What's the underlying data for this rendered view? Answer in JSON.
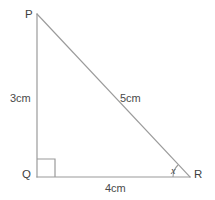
{
  "figure": {
    "kind": "geometry-diagram",
    "shape": "right-triangle",
    "background_color": "#ffffff",
    "stroke_color": "#9a9a9a",
    "text_color": "#4a4a4a",
    "vertices": [
      {
        "name": "P",
        "label": "P",
        "x": 37,
        "y": 14
      },
      {
        "name": "Q",
        "label": "Q",
        "x": 37,
        "y": 177
      },
      {
        "name": "R",
        "label": "R",
        "x": 190,
        "y": 177
      }
    ],
    "sides": [
      {
        "name": "PQ",
        "label": "3cm",
        "value": 3,
        "unit": "cm"
      },
      {
        "name": "PR",
        "label": "5cm",
        "value": 5,
        "unit": "cm"
      },
      {
        "name": "QR",
        "label": "4cm",
        "value": 4,
        "unit": "cm"
      }
    ],
    "angles": [
      {
        "name": "Q",
        "label": "",
        "type": "right-angle",
        "marker": "square"
      },
      {
        "name": "R",
        "label": "x",
        "type": "unknown",
        "marker": "arc"
      }
    ],
    "right_angle_marker": {
      "at": "Q",
      "size": 18
    },
    "angle_arc": {
      "at": "R",
      "radius": 17
    }
  }
}
